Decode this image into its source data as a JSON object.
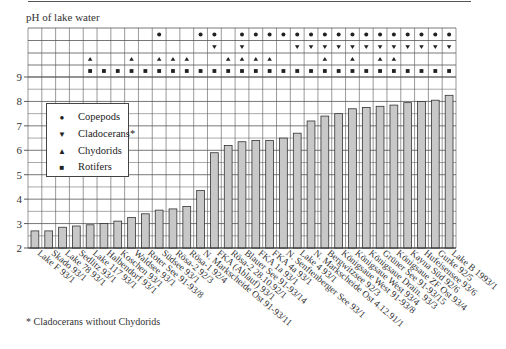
{
  "chart_data": {
    "type": "bar",
    "title": "pH of lake water",
    "xlabel": "",
    "ylabel": "pH of lake water",
    "ylim": [
      2,
      9
    ],
    "yticks": [
      2,
      3,
      4,
      5,
      6,
      7,
      8,
      9
    ],
    "grid": true,
    "legend_position": "upper-left inside",
    "categories": [
      "Lake F 93/1",
      "Skado 93/1",
      "Lake 78 93/1",
      "Sedlitz 93/1",
      "Lake 117 93/1",
      "Halbendorf 93/1",
      "Koschen 93/1",
      "Waldsee 93/1",
      "Roter See 91-93/8",
      "Südsee 93/1",
      "Rösa-2 92/3",
      "Rösa-1 92/4",
      "N. Markscheide Ost 91-93/11",
      "FKA (Ablauf) 93/1",
      "Rösa-2 28.10.92/1",
      "Blauer See 91-93/14",
      "FKA 1a 93/1",
      "FKA 4a 93/1",
      "N. Senftenberger See 93/1",
      "Lake 4 93/1",
      "N. Markscheide Ost 4.12.91/1",
      "Bergwitzsee 92/3",
      "Königsaue West 91-93/8",
      "Königsaue West 93/4",
      "Königsaue Drain. 93/3",
      "Grüner See 91-93/15",
      "Königsaue ZF Ost 93/4",
      "Kayna Süd 92/6",
      "Hufeisensee 93/6",
      "Gurke 92/5",
      "Lake B 1993/1"
    ],
    "values": [
      2.7,
      2.7,
      2.85,
      2.9,
      2.95,
      3.0,
      3.1,
      3.25,
      3.4,
      3.55,
      3.6,
      3.7,
      4.35,
      5.9,
      6.2,
      6.35,
      6.4,
      6.4,
      6.5,
      6.7,
      7.2,
      7.4,
      7.5,
      7.7,
      7.75,
      7.8,
      7.85,
      7.95,
      8.0,
      8.05,
      8.25
    ],
    "presence_rows": [
      {
        "name": "Copepods",
        "symbol": "●",
        "present": [
          0,
          0,
          0,
          0,
          0,
          0,
          0,
          0,
          0,
          1,
          0,
          0,
          1,
          1,
          0,
          1,
          1,
          1,
          1,
          1,
          1,
          1,
          1,
          1,
          1,
          1,
          1,
          1,
          1,
          1,
          1
        ]
      },
      {
        "name": "Cladocerans*",
        "symbol": "▼",
        "present": [
          0,
          0,
          0,
          0,
          0,
          0,
          0,
          0,
          0,
          0,
          0,
          0,
          0,
          1,
          0,
          1,
          0,
          0,
          0,
          1,
          1,
          1,
          1,
          1,
          1,
          1,
          1,
          1,
          1,
          1,
          1
        ]
      },
      {
        "name": "Chydorids",
        "symbol": "▲",
        "present": [
          0,
          0,
          0,
          0,
          1,
          0,
          0,
          1,
          0,
          1,
          1,
          1,
          0,
          0,
          1,
          1,
          1,
          1,
          0,
          0,
          0,
          1,
          0,
          1,
          0,
          1,
          1,
          0,
          0,
          0,
          0
        ]
      },
      {
        "name": "Rotifers",
        "symbol": "■",
        "present": [
          0,
          0,
          0,
          0,
          1,
          1,
          1,
          1,
          1,
          1,
          1,
          1,
          1,
          1,
          1,
          1,
          1,
          1,
          1,
          1,
          1,
          1,
          1,
          1,
          1,
          1,
          1,
          1,
          1,
          1,
          1
        ]
      }
    ],
    "legend": [
      {
        "symbol": "●",
        "label": "Copepods"
      },
      {
        "symbol": "▼",
        "label": "Cladocerans*"
      },
      {
        "symbol": "▲",
        "label": "Chydorids"
      },
      {
        "symbol": "■",
        "label": "Rotifers"
      }
    ],
    "footnote": "* Cladocerans without Chydorids",
    "colors": {
      "bar_fill": "#c8c8c8",
      "bar_stroke": "#333333",
      "grid": "#555555",
      "marker": "#222222"
    }
  }
}
